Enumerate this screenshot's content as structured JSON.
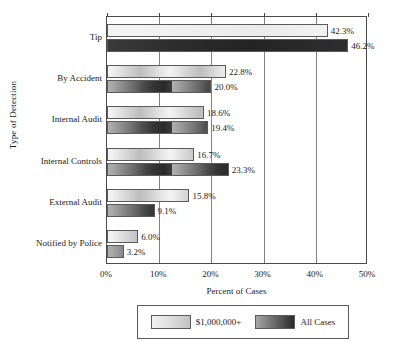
{
  "chart_data": {
    "type": "bar",
    "orientation": "horizontal",
    "title": "",
    "xlabel": "Percent of Cases",
    "ylabel": "Type of Detection",
    "categories": [
      "Tip",
      "By Accident",
      "Internal Audit",
      "Internal Controls",
      "External Audit",
      "Notified by Police"
    ],
    "series": [
      {
        "name": "$1,000,000+",
        "values": [
          42.3,
          22.8,
          18.6,
          16.7,
          15.8,
          6.0
        ],
        "labels": [
          "42.3%",
          "22.8%",
          "18.6%",
          "16.7%",
          "15.8%",
          "6.0%"
        ],
        "style": "light"
      },
      {
        "name": "All Cases",
        "values": [
          46.2,
          20.0,
          19.4,
          23.3,
          9.1,
          3.2
        ],
        "labels": [
          "46.2%",
          "20.0%",
          "19.4%",
          "23.3%",
          "9.1%",
          "3.2%"
        ],
        "style": "dark"
      }
    ],
    "xlim": [
      0,
      50
    ],
    "xticks": [
      0,
      10,
      20,
      30,
      40,
      50
    ],
    "xtick_labels": [
      "0%",
      "10%",
      "20%",
      "30%",
      "40%",
      "50%"
    ],
    "grid": "vertical",
    "legend_position": "bottom-center"
  },
  "legend": {
    "entries": [
      {
        "label": "$1,000,000+",
        "swatch": "light-gradient-swatch"
      },
      {
        "label": "All Cases",
        "swatch": "dark-gradient-swatch"
      }
    ]
  },
  "axes": {
    "x_title": "Percent of Cases",
    "y_title": "Type of Detection"
  },
  "colors": {
    "light_series_start": "#f2f2f2",
    "light_series_end": "#bdbdbd",
    "dark_series_start": "#a8a8a8",
    "dark_series_end": "#242424",
    "axis": "#4a4a4a",
    "gridline": "#808080",
    "text": "#1a1a1a",
    "background": "#ffffff"
  }
}
